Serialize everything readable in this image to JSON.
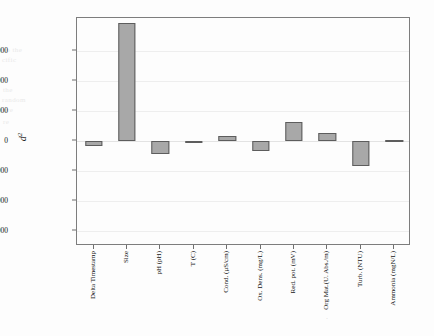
{
  "figure": {
    "background": "#ffffff",
    "bar_fill": "#a8a8a8",
    "bar_edge": "#5d5d5d",
    "axis_color": "#7d7d7d",
    "grid_color": "#eeeeee",
    "y_axis_label": "d",
    "y_axis_label_sup": "2",
    "y_axis_label_sub": "i"
  },
  "chart_data": {
    "type": "bar",
    "title": "",
    "xlabel": "",
    "ylabel": "d²",
    "ylim": [
      -17500,
      20500
    ],
    "yticks": [
      15000,
      10000,
      5000,
      0,
      -5000,
      -10000,
      -15000
    ],
    "ytick_labels": [
      "15000",
      "10000",
      "5000",
      "0",
      "−5000",
      "−10000",
      "−15000"
    ],
    "grid": true,
    "legend": "none",
    "categories": [
      "Delta Timestamp",
      "Size",
      "pH (pH)",
      "T (C)",
      "Cond. (µS/cm)",
      "Ox. Dens. (mg/L)",
      "Red. pot. (mV)",
      "Org Mat.(U. Abs./m)",
      "Turb. (NTU)",
      "Ammonia (mgN/L)"
    ],
    "values": [
      -900,
      19700,
      -2200,
      -150,
      900,
      -1700,
      3200,
      1300,
      -4200,
      150
    ]
  },
  "ghost_text": [
    {
      "text": "to the",
      "x": 4,
      "y": 46
    },
    {
      "text": "cific",
      "x": 2,
      "y": 56
    },
    {
      "text": "the",
      "x": 3,
      "y": 86
    },
    {
      "text": "random",
      "x": 2,
      "y": 96
    },
    {
      "text": "ure",
      "x": 3,
      "y": 106
    },
    {
      "text": "re",
      "x": 3,
      "y": 118
    }
  ],
  "stray_marks": [
    {
      "text": "·",
      "x": 326,
      "y": 316
    }
  ]
}
